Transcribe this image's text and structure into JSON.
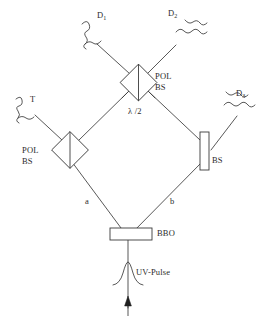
{
  "figure": {
    "type": "optics-setup-diagram",
    "stroke_color": "#3a3a3a",
    "text_color": "#2b2b2b",
    "background": "#ffffff"
  },
  "labels": {
    "detector_d1": "D",
    "detector_d1_sub": "1",
    "detector_d2": "D",
    "detector_d2_sub": "2",
    "detector_d3": "D",
    "detector_d3_sub": "3",
    "detector_t": "T",
    "pol_bs_top_line1": "POL",
    "pol_bs_top_line2": "BS",
    "pol_bs_left_line1": "POL",
    "pol_bs_left_line2": "BS",
    "beam_splitter_right": "BS",
    "half_wave_plate": "λ /2",
    "crystal": "BBO",
    "pump": "UV-Pulse",
    "path_a": "a",
    "path_b": "b"
  },
  "components": [
    {
      "name": "bbo-crystal",
      "shape": "rectangle",
      "label": "BBO"
    },
    {
      "name": "pol-bs-left",
      "shape": "diamond-with-vertical-bar",
      "label": "POL BS"
    },
    {
      "name": "pol-bs-top",
      "shape": "diamond-with-vertical-bar",
      "label": "POL BS"
    },
    {
      "name": "bs-right",
      "shape": "vertical-rectangle",
      "label": "BS"
    },
    {
      "name": "half-wave-plate",
      "shape": "text-annotation",
      "label": "λ /2"
    }
  ],
  "detectors": [
    {
      "name": "detector-t",
      "label": "T",
      "icon": "squiggle-detector-icon"
    },
    {
      "name": "detector-d1",
      "label": "D1",
      "icon": "squiggle-detector-icon"
    },
    {
      "name": "detector-d2",
      "label": "D2",
      "icon": "squiggle-detector-icon"
    },
    {
      "name": "detector-d3",
      "label": "D3",
      "icon": "squiggle-detector-icon"
    }
  ],
  "beam_paths": [
    {
      "name": "path-a",
      "label": "a",
      "from": "bbo-crystal",
      "to": "pol-bs-left"
    },
    {
      "name": "path-b",
      "label": "b",
      "from": "bbo-crystal",
      "to": "bs-right"
    },
    {
      "name": "path-left-up",
      "from": "pol-bs-left",
      "to": "pol-bs-top"
    },
    {
      "name": "path-right-up",
      "from": "bs-right",
      "to": "pol-bs-top"
    },
    {
      "name": "path-d1-out",
      "from": "pol-bs-top",
      "to": "detector-d1"
    },
    {
      "name": "path-d2-out",
      "from": "pol-bs-top",
      "to": "detector-d2"
    },
    {
      "name": "path-t-out",
      "from": "pol-bs-left",
      "to": "detector-t"
    },
    {
      "name": "path-d3-out",
      "from": "bs-right",
      "to": "detector-d3"
    },
    {
      "name": "path-pump",
      "from": "uv-pulse-source",
      "to": "bbo-crystal"
    }
  ]
}
